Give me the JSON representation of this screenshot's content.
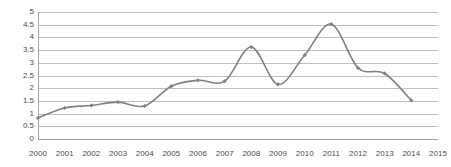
{
  "chart_data": {
    "type": "line",
    "title": "",
    "subtitle": "",
    "xlabel": "",
    "ylabel": "",
    "categories": [
      "2000",
      "2001",
      "2002",
      "2003",
      "2004",
      "2005",
      "2006",
      "2007",
      "2008",
      "2009",
      "2010",
      "2011",
      "2012",
      "2013",
      "2014",
      "2015"
    ],
    "values": [
      0.83,
      1.22,
      1.32,
      1.45,
      1.3,
      2.08,
      2.31,
      2.28,
      3.62,
      2.15,
      3.3,
      4.52,
      2.8,
      2.58,
      1.52,
      null
    ],
    "series": [
      {
        "name": "series-1",
        "values": [
          0.83,
          1.22,
          1.32,
          1.45,
          1.3,
          2.08,
          2.31,
          2.28,
          3.62,
          2.15,
          3.3,
          4.52,
          2.8,
          2.58,
          1.52,
          null
        ]
      }
    ],
    "x": [
      "2000",
      "2001",
      "2002",
      "2003",
      "2004",
      "2005",
      "2006",
      "2007",
      "2008",
      "2009",
      "2010",
      "2011",
      "2012",
      "2013",
      "2014",
      "2015"
    ],
    "ylim": [
      0,
      5
    ],
    "y_ticks": [
      "0",
      "0.5",
      "1",
      "1.5",
      "2",
      "2.5",
      "3",
      "3.5",
      "4",
      "4.5",
      "5"
    ],
    "y_tick_values": [
      0,
      0.5,
      1,
      1.5,
      2,
      2.5,
      3,
      3.5,
      4,
      4.5,
      5
    ],
    "x_ticks": [
      "2000",
      "2001",
      "2002",
      "2003",
      "2004",
      "2005",
      "2006",
      "2007",
      "2008",
      "2009",
      "2010",
      "2011",
      "2012",
      "2013",
      "2014",
      "2015"
    ],
    "grid": true,
    "grid_axis": "y",
    "legend": false,
    "legend_position": "none",
    "annotations": [],
    "smoothing": "spline",
    "markers": "diamond",
    "colors": {
      "line": "#808080",
      "marker": "#808080",
      "gridline": "#bfbfbf",
      "axis": "#a6a6a6",
      "tick_label": "#4d4d4d",
      "background": "#ffffff"
    }
  }
}
